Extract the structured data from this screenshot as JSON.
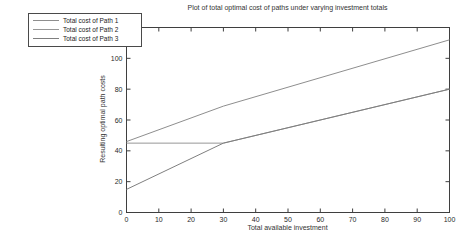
{
  "figure": {
    "background": "#ffffff",
    "axis_color": "#3f3f3f",
    "tick_label_color": "#2a2a2a"
  },
  "chart_data": {
    "type": "line",
    "title": "Plot of total optimal cost of paths under varying investment totals",
    "xlabel": "Total available investment",
    "ylabel": "Resulting optimal path costs",
    "xlim": [
      0,
      100
    ],
    "ylim": [
      0,
      120
    ],
    "xticks": [
      0,
      10,
      20,
      30,
      40,
      50,
      60,
      70,
      80,
      90,
      100
    ],
    "yticks": [
      0,
      20,
      40,
      60,
      80,
      100,
      120
    ],
    "grid": false,
    "legend_position": "outside-top-left",
    "series": [
      {
        "name": "Total cost of Path 1",
        "color": "#8e8e8e",
        "points": [
          [
            0,
            46
          ],
          [
            30,
            69
          ],
          [
            100,
            112
          ]
        ]
      },
      {
        "name": "Total cost of Path 2",
        "color": "#979797",
        "points": [
          [
            0,
            45
          ],
          [
            30,
            45
          ],
          [
            100,
            80
          ]
        ]
      },
      {
        "name": "Total cost of Path 3",
        "color": "#7f7f7f",
        "points": [
          [
            0,
            15
          ],
          [
            30,
            45
          ],
          [
            100,
            80
          ]
        ]
      }
    ]
  }
}
